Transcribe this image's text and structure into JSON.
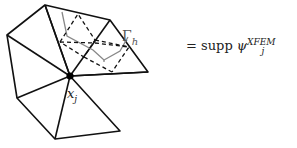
{
  "labels": {
    "interface_symbol": "Γ",
    "interface_sub": "h",
    "node_symbol": "x",
    "node_sub": "j",
    "equation_prefix": "= supp ",
    "equation_func": "ψ",
    "equation_sup": "XFEM",
    "equation_sub": "j"
  },
  "colors": {
    "mesh": "#111111",
    "interface": "#888888",
    "dashed": "#111111"
  }
}
